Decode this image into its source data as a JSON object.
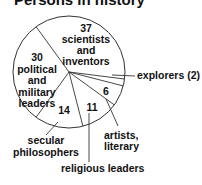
{
  "chart_data": {
    "type": "pie",
    "title": "Persons in history",
    "total": 100,
    "start_angle_deg": 234,
    "direction": "clockwise",
    "slices": [
      {
        "name": "scientists and inventors",
        "value": 37,
        "label_lines": [
          "37",
          "scientists",
          "and",
          "inventors"
        ],
        "label_inside": true
      },
      {
        "name": "explorers",
        "value": 2,
        "label_lines": [
          "explorers (2)"
        ],
        "label_inside": false
      },
      {
        "name": "artists, literary",
        "value": 6,
        "number": "6",
        "label_lines": [
          "artists,",
          "literary"
        ],
        "label_inside": false
      },
      {
        "name": "religious leaders",
        "value": 11,
        "number": "11",
        "label_lines": [
          "religious leaders"
        ],
        "label_inside": false
      },
      {
        "name": "secular philosophers",
        "value": 14,
        "number": "14",
        "label_lines": [
          "secular",
          "philosophers"
        ],
        "label_inside": false
      },
      {
        "name": "political and military leaders",
        "value": 30,
        "label_lines": [
          "30",
          "political",
          "and",
          "military",
          "leaders"
        ],
        "label_inside": true
      }
    ],
    "colors": {
      "fill": "#ffffff",
      "stroke": "#333333",
      "text": "#111111"
    }
  }
}
